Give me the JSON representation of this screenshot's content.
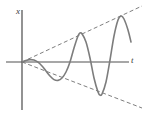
{
  "figure": {
    "kind": "growing-oscillation-resonance-plot",
    "background_color": "#ffffff",
    "width": 145,
    "height": 118
  },
  "axes": {
    "vertical": {
      "label": "x",
      "color": "#4a4a4a",
      "x": 22,
      "y_top": 10,
      "y_bottom": 110
    },
    "horizontal": {
      "label": "t",
      "color": "#8a8a8a",
      "y": 62,
      "x_left": 6,
      "x_right": 129
    },
    "origin": {
      "x": 22,
      "y": 62
    }
  },
  "chart_data": {
    "type": "line",
    "title": "",
    "xlabel": "t",
    "ylabel": "x",
    "grid": false,
    "legend": null,
    "series": [
      {
        "name": "oscillation",
        "description": "sinusoid with linearly growing amplitude",
        "color": "#7d7d7d",
        "stroke_width": 1.6,
        "dashed": false,
        "points": [
          [
            22,
            62
          ],
          [
            26,
            60.4
          ],
          [
            30,
            59.6
          ],
          [
            34,
            60.0
          ],
          [
            38,
            62.2
          ],
          [
            42,
            66.0
          ],
          [
            46,
            71.0
          ],
          [
            50,
            76.0
          ],
          [
            54,
            79.6
          ],
          [
            58,
            80.4
          ],
          [
            62,
            78.0
          ],
          [
            66,
            72.0
          ],
          [
            70,
            62.0
          ],
          [
            74,
            48.0
          ],
          [
            78,
            36.0
          ],
          [
            80,
            33.0
          ],
          [
            82,
            33.8
          ],
          [
            86,
            42.0
          ],
          [
            90,
            58.0
          ],
          [
            94,
            78.0
          ],
          [
            98,
            92.0
          ],
          [
            100,
            95.0
          ],
          [
            102,
            94.0
          ],
          [
            106,
            82.0
          ],
          [
            110,
            60.0
          ],
          [
            114,
            36.0
          ],
          [
            118,
            20.0
          ],
          [
            121,
            16.0
          ],
          [
            124,
            19.0
          ],
          [
            128,
            30.0
          ],
          [
            131,
            42.0
          ]
        ]
      },
      {
        "name": "upper-envelope",
        "description": "dashed straight line through successive maxima",
        "color": "#6f6f6f",
        "stroke_width": 0.9,
        "dashed": true,
        "points": [
          [
            22,
            62
          ],
          [
            142,
            6
          ]
        ]
      },
      {
        "name": "lower-envelope",
        "description": "dashed straight line through successive minima",
        "color": "#6f6f6f",
        "stroke_width": 0.9,
        "dashed": true,
        "points": [
          [
            22,
            62
          ],
          [
            142,
            108
          ]
        ]
      }
    ],
    "annotations": [
      {
        "name": "x-axis-label",
        "text": "x",
        "x": 16,
        "y": 7
      },
      {
        "name": "t-axis-label",
        "text": "t",
        "x": 131,
        "y": 56
      }
    ],
    "extrema": {
      "maxima": [
        [
          30,
          59.6
        ],
        [
          80,
          33.0
        ],
        [
          121,
          16.0
        ]
      ],
      "minima": [
        [
          58,
          80.4
        ],
        [
          100,
          95.0
        ]
      ]
    }
  }
}
